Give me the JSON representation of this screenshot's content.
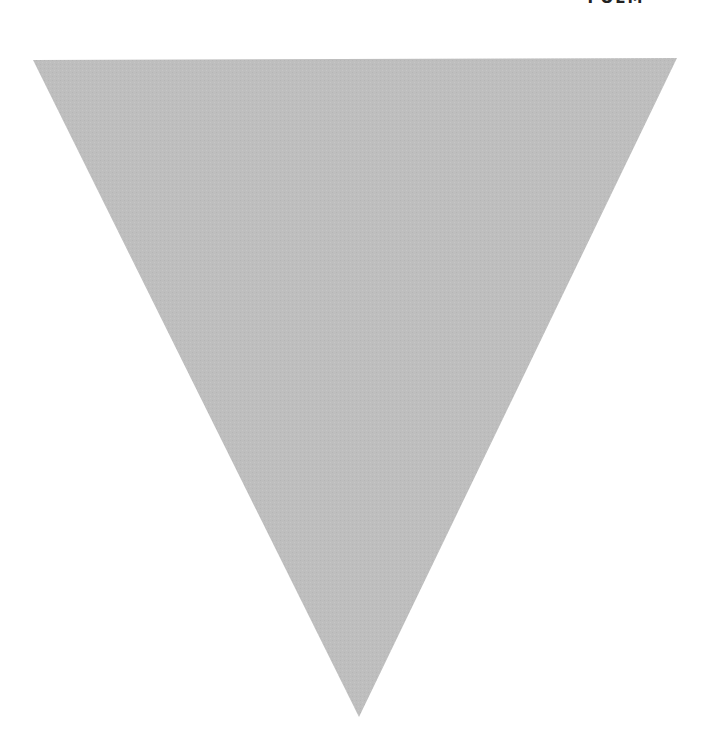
{
  "page": {
    "header_label": "- POEM -"
  },
  "shape": {
    "type": "inverted-triangle",
    "fill_color": "#bdbdbd",
    "points": [
      [
        33,
        60
      ],
      [
        677,
        58
      ],
      [
        359,
        717
      ]
    ]
  }
}
